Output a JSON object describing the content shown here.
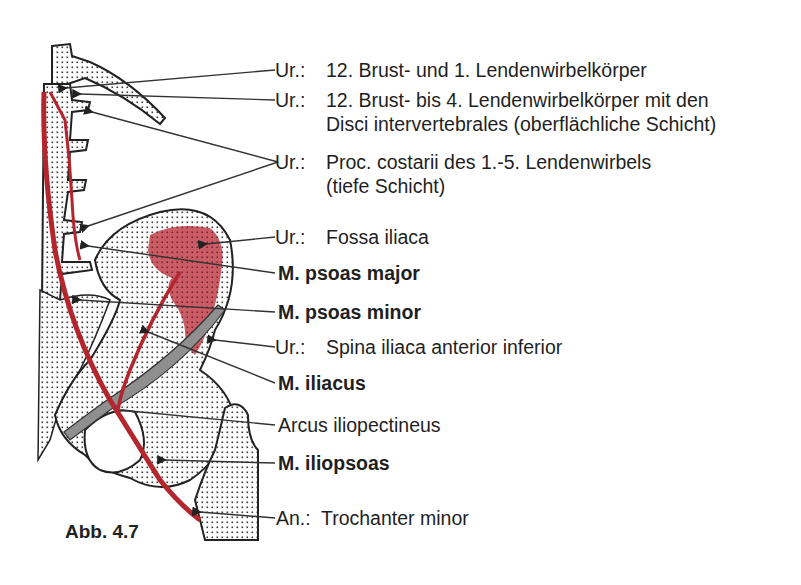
{
  "figure": {
    "caption": "Abb.  4.7",
    "colors": {
      "muscle_red": "#b3262e",
      "fossa_fill": "#c0454f",
      "bone_stipple": "#2a2a2a",
      "ligament_gray": "#8a8a8a",
      "line": "#333333"
    }
  },
  "labels": [
    {
      "id": "origin-1",
      "prefix": "Ur.:",
      "text": "12. Brust- und 1. Lendenwirbelkörper",
      "bold": false
    },
    {
      "id": "origin-2",
      "prefix": "Ur.:",
      "text": "12. Brust- bis 4. Lendenwirbelkörper mit den",
      "continuation": "Disci intervertebrales (oberflächliche Schicht)",
      "bold": false
    },
    {
      "id": "origin-3",
      "prefix": "Ur.:",
      "text": "Proc. costarii des 1.-5. Lendenwirbels",
      "continuation": "(tiefe Schicht)",
      "bold": false
    },
    {
      "id": "origin-4",
      "prefix": "Ur.:",
      "text": "Fossa iliaca",
      "bold": false
    },
    {
      "id": "psoas-major",
      "text": "M. psoas major",
      "bold": true
    },
    {
      "id": "psoas-minor",
      "text": "M. psoas minor",
      "bold": true
    },
    {
      "id": "origin-5",
      "prefix": "Ur.:",
      "text": "Spina iliaca anterior inferior",
      "bold": false
    },
    {
      "id": "iliacus",
      "text": "M. iliacus",
      "bold": true
    },
    {
      "id": "arcus",
      "text": "Arcus iliopectineus",
      "bold": false
    },
    {
      "id": "iliopsoas",
      "text": "M. iliopsoas",
      "bold": true
    },
    {
      "id": "insertion",
      "prefix": "An.:",
      "text": "Trochanter minor",
      "bold": false
    }
  ]
}
